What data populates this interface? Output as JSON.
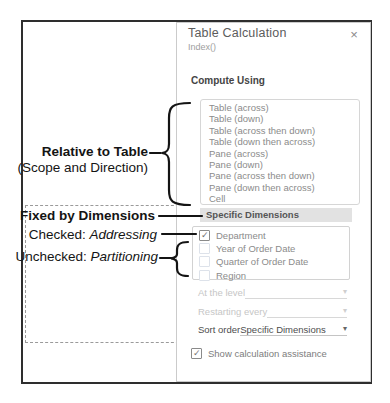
{
  "dialog": {
    "title": "Table Calculation",
    "subtitle": "Index()",
    "compute_using_label": "Compute Using",
    "scope_options": [
      "Table (across)",
      "Table (down)",
      "Table (across then down)",
      "Table (down then across)",
      "Pane (across)",
      "Pane (down)",
      "Pane (across then down)",
      "Pane (down then across)",
      "Cell"
    ],
    "specific_dimensions_label": "Specific Dimensions",
    "dimensions": [
      {
        "label": "Department",
        "checked": true
      },
      {
        "label": "Year of Order Date",
        "checked": false
      },
      {
        "label": "Quarter of Order Date",
        "checked": false
      },
      {
        "label": "Region",
        "checked": false
      }
    ],
    "at_the_level": {
      "label": "At the level",
      "value": "",
      "disabled": true
    },
    "restarting_every": {
      "label": "Restarting every",
      "value": "",
      "disabled": true
    },
    "sort_order": {
      "label": "Sort order",
      "value": "Specific Dimensions",
      "disabled": false
    },
    "show_assistance": {
      "label": "Show calculation assistance",
      "checked": true
    }
  },
  "annotations": {
    "relative_to_table": {
      "title": "Relative to Table",
      "subtitle": "(Scope and Direction)"
    },
    "fixed_by_dimensions": "Fixed by Dimensions",
    "checked_label": {
      "prefix": "Checked: ",
      "term": "Addressing"
    },
    "unchecked_label": {
      "prefix": "Unchecked: ",
      "term": "Partitioning"
    }
  },
  "icons": {
    "close": "×",
    "caret": "▾",
    "check": "✓"
  },
  "colors": {
    "frame_border": "#2e2e2e",
    "panel_border": "#cbcbcb",
    "highlight_band": "#e2e2e2",
    "muted_text": "#8b8b8b",
    "disabled_text": "#c6c6c6",
    "annotation_ink": "#141414"
  }
}
